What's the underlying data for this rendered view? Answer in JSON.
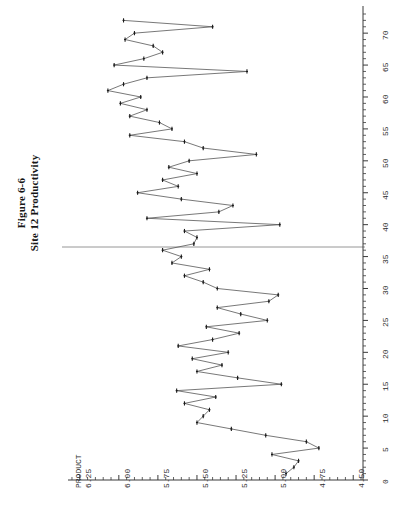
{
  "figure": {
    "title_line1": "Figure 6-6",
    "title_line2": "Site 12 Productivity"
  },
  "axes": {
    "value_axis_name": "PRODUCT",
    "value_ticks": [
      "6.25",
      "6.00",
      "5.75",
      "5.50",
      "5.25",
      "5.00",
      "4.75",
      "4.50"
    ],
    "index_ticks": [
      "0",
      "5",
      "10",
      "15",
      "20",
      "25",
      "30",
      "35",
      "40",
      "45",
      "50",
      "55",
      "60",
      "65",
      "70"
    ]
  },
  "style": {
    "line_color": "#555555",
    "marker_color": "#1a1a1a",
    "axis_color": "#3a3a3a",
    "reference_line_color": "#8a8a8a",
    "background": "#ffffff"
  },
  "chart_data": {
    "type": "line",
    "title": "Figure 6-6 Site 12 Productivity",
    "orientation": "rotated-90",
    "xlabel": "Observation",
    "ylabel": "PRODUCT",
    "xlim": [
      0,
      73
    ],
    "ylim": [
      4.5,
      6.3
    ],
    "grid": false,
    "legend": "none",
    "markers": true,
    "reference_line": {
      "axis": "x",
      "value": 36.5,
      "label": ""
    },
    "x": [
      1,
      2,
      3,
      4,
      5,
      6,
      7,
      8,
      9,
      10,
      11,
      12,
      13,
      14,
      15,
      16,
      17,
      18,
      19,
      20,
      21,
      22,
      23,
      24,
      25,
      26,
      27,
      28,
      29,
      30,
      31,
      32,
      33,
      34,
      35,
      36,
      37,
      38,
      39,
      40,
      41,
      42,
      43,
      44,
      45,
      46,
      47,
      48,
      49,
      50,
      51,
      52,
      53,
      54,
      55,
      56,
      57,
      58,
      59,
      60,
      61,
      62,
      63,
      64,
      65,
      66,
      67,
      68,
      69,
      70,
      71,
      72
    ],
    "y": [
      4.93,
      4.88,
      4.85,
      5.02,
      4.72,
      4.8,
      5.06,
      5.28,
      5.5,
      5.46,
      5.42,
      5.58,
      5.38,
      5.63,
      4.96,
      5.24,
      5.5,
      5.34,
      5.53,
      5.3,
      5.62,
      5.4,
      5.23,
      5.44,
      5.05,
      5.22,
      5.37,
      5.04,
      4.98,
      5.37,
      5.46,
      5.58,
      5.42,
      5.66,
      5.6,
      5.72,
      5.52,
      5.5,
      5.58,
      4.97,
      5.82,
      5.36,
      5.27,
      5.6,
      5.88,
      5.62,
      5.72,
      5.5,
      5.68,
      5.55,
      5.12,
      5.46,
      5.58,
      5.93,
      5.66,
      5.74,
      5.93,
      5.82,
      5.99,
      5.86,
      6.07,
      5.97,
      5.82,
      5.18,
      6.03,
      5.84,
      5.72,
      5.78,
      5.96,
      5.9,
      5.4,
      5.97
    ],
    "marker_style": "plus-tick",
    "series_name": "PRODUCT"
  }
}
